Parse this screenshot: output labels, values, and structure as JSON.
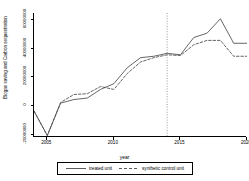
{
  "chart_data": {
    "type": "line",
    "title": "",
    "xlabel": "year",
    "ylabel": "Biogas saving and Carbon sequestration",
    "xlim": [
      2004,
      2020
    ],
    "ylim": [
      -22000000,
      64000000
    ],
    "grid": false,
    "legend_position": "bottom",
    "x_ticks": [
      "2005",
      "2010",
      "2015",
      "2020"
    ],
    "x_tick_values": [
      2005,
      2010,
      2015,
      2020
    ],
    "y_ticks": [
      "-20000000",
      "0",
      "20000000",
      "40000000",
      "60000000"
    ],
    "y_tick_values": [
      -20000000,
      0,
      20000000,
      40000000,
      60000000
    ],
    "x": [
      2004,
      2005,
      2006,
      2007,
      2008,
      2009,
      2010,
      2011,
      2012,
      2013,
      2014,
      2015,
      2016,
      2017,
      2018,
      2019,
      2020
    ],
    "series": [
      {
        "name": "treated unit",
        "style": "solid",
        "color": "#4a4a4a",
        "values": [
          -4000000,
          -21000000,
          1500000,
          4000000,
          5000000,
          11000000,
          15000000,
          26000000,
          33000000,
          34000000,
          36000000,
          35000000,
          47000000,
          50000000,
          60000000,
          43000000,
          43000000
        ]
      },
      {
        "name": "synthetic control unit",
        "style": "dashed",
        "color": "#4a4a4a",
        "values": [
          -4000000,
          -21000000,
          2000000,
          7500000,
          8000000,
          13000000,
          11000000,
          22000000,
          30000000,
          33000000,
          35000000,
          34500000,
          42000000,
          45000000,
          45000000,
          34000000,
          34000000
        ]
      }
    ],
    "annotations": [
      {
        "type": "vline",
        "x": 2014,
        "style": "dotted",
        "color": "#555555"
      }
    ]
  },
  "legend": {
    "entries": [
      {
        "label": "treated unit"
      },
      {
        "label": "synthetic control unit"
      }
    ]
  }
}
